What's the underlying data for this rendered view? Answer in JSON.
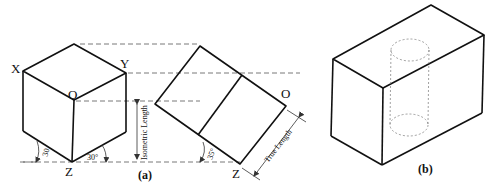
{
  "figure_a": {
    "caption": "(a)",
    "cube_labels": {
      "x": "X",
      "y": "Y",
      "o": "O",
      "z": "Z"
    },
    "angle_left": "30",
    "angle_right": "30°",
    "dimension_isometric": "Isometric Length",
    "rotated_labels": {
      "o": "O",
      "z": "Z"
    },
    "angle_rotated": "35°",
    "dimension_true": "True Length"
  },
  "figure_b": {
    "caption": "(b)"
  }
}
